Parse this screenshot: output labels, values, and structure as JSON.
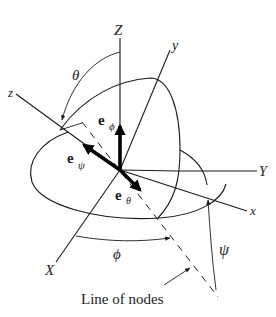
{
  "figure": {
    "type": "euler-angles-diagram",
    "axes": {
      "Z": "Z",
      "Y": "Y",
      "X": "X",
      "z": "z",
      "y": "y",
      "x": "x"
    },
    "angles": {
      "theta": "θ",
      "phi": "ϕ",
      "psi": "ψ"
    },
    "unit_vectors": {
      "e_phi": {
        "base": "e",
        "sub": "ϕ"
      },
      "e_psi": {
        "base": "e",
        "sub": "ψ"
      },
      "e_theta": {
        "base": "e",
        "sub": "θ"
      }
    },
    "caption": "Line of nodes",
    "colors": {
      "ink": "#1a1a1a",
      "background": "#ffffff"
    }
  }
}
